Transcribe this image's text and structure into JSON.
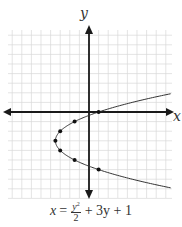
{
  "chart_data": {
    "type": "line",
    "title": "",
    "xlabel": "x",
    "ylabel": "y",
    "equation": "x = y^2/2 + 3y + 1",
    "grid": true,
    "xlim": [
      -8,
      8
    ],
    "ylim": [
      -9,
      8
    ],
    "series": [
      {
        "name": "x = y^2/2 + 3y + 1",
        "style": "curve-with-markers",
        "points": [
          {
            "x": 1,
            "y": 0
          },
          {
            "x": -1.5,
            "y": -1
          },
          {
            "x": -3,
            "y": -2
          },
          {
            "x": -3.5,
            "y": -3
          },
          {
            "x": -3,
            "y": -4
          },
          {
            "x": -1.5,
            "y": -5
          },
          {
            "x": 1,
            "y": -6
          }
        ]
      }
    ]
  },
  "labels": {
    "x_axis": "x",
    "y_axis": "y",
    "equation": {
      "lhs": "x",
      "eq": "=",
      "num": "y",
      "num_exp": "2",
      "den": "2",
      "rest": "+ 3y + 1"
    }
  },
  "colors": {
    "axis": "#1a1a1a",
    "grid": "#d9d9d9",
    "curve": "#333333",
    "marker": "#111111"
  },
  "layout": {
    "origin_px": [
      89,
      112
    ],
    "unit_px": 9.6,
    "grid_px": {
      "left": 8,
      "right": 172,
      "top": 30,
      "bottom": 198
    }
  }
}
